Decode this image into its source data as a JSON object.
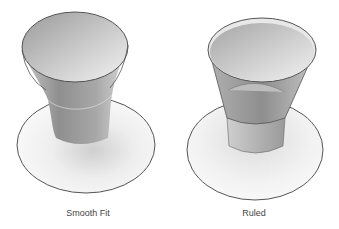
{
  "figures": [
    {
      "id": "smooth-fit",
      "label": "Smooth Fit",
      "type": "smooth loft surface"
    },
    {
      "id": "ruled",
      "label": "Ruled",
      "type": "ruled loft surface"
    }
  ],
  "colors": {
    "outline": "#555555",
    "light": "#f4f4f4",
    "mid": "#b8b8b8",
    "dark": "#8a8a8a"
  }
}
